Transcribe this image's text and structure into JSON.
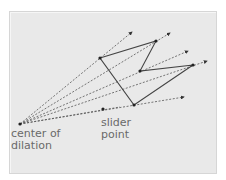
{
  "labels": {
    "center": [
      "center of",
      "dilation"
    ],
    "slider": [
      "slider",
      "point"
    ]
  },
  "colors": {
    "panel": "#e9e9e9",
    "line": "#444444",
    "ray": "#555555",
    "text": "#6a6a6a"
  },
  "center": [
    20,
    124
  ],
  "slider_point": [
    103,
    109
  ],
  "polygon": [
    [
      100,
      58
    ],
    [
      156,
      41
    ],
    [
      140,
      71
    ],
    [
      193,
      65
    ],
    [
      134,
      105
    ]
  ],
  "ray_tips": [
    [
      132,
      32
    ],
    [
      170,
      33
    ],
    [
      188,
      51
    ],
    [
      207,
      61
    ],
    [
      184,
      97
    ],
    [
      120,
      107
    ]
  ]
}
